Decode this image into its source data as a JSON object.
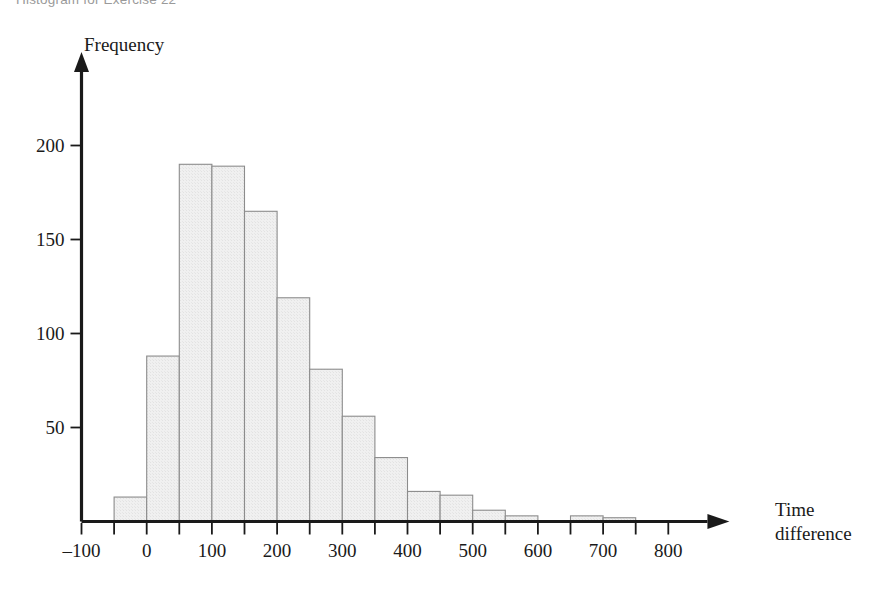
{
  "caption": "Histogram for Exercise 22",
  "chart_data": {
    "type": "bar",
    "title": "Histogram for Exercise 22",
    "xlabel": "Time difference",
    "xlabel_lines": [
      "Time",
      "difference"
    ],
    "ylabel": "Frequency",
    "xlim": [
      -100,
      850
    ],
    "ylim": [
      0,
      210
    ],
    "bin_width": 50,
    "grid": false,
    "legend": null,
    "x_ticks": [
      -100,
      -50,
      0,
      50,
      100,
      150,
      200,
      250,
      300,
      350,
      400,
      450,
      500,
      550,
      600,
      650,
      700,
      750,
      800
    ],
    "x_tick_labels": [
      {
        "value": -100,
        "label": "–100"
      },
      {
        "value": 0,
        "label": "0"
      },
      {
        "value": 100,
        "label": "100"
      },
      {
        "value": 200,
        "label": "200"
      },
      {
        "value": 300,
        "label": "300"
      },
      {
        "value": 400,
        "label": "400"
      },
      {
        "value": 500,
        "label": "500"
      },
      {
        "value": 600,
        "label": "600"
      },
      {
        "value": 700,
        "label": "700"
      },
      {
        "value": 800,
        "label": "800"
      }
    ],
    "y_ticks": [
      50,
      100,
      150,
      200
    ],
    "y_tick_labels": [
      "50",
      "100",
      "150",
      "200"
    ],
    "bins": [
      {
        "start": -50,
        "end": 0,
        "value": 13
      },
      {
        "start": 0,
        "end": 50,
        "value": 88
      },
      {
        "start": 50,
        "end": 100,
        "value": 190
      },
      {
        "start": 100,
        "end": 150,
        "value": 189
      },
      {
        "start": 150,
        "end": 200,
        "value": 165
      },
      {
        "start": 200,
        "end": 250,
        "value": 119
      },
      {
        "start": 250,
        "end": 300,
        "value": 81
      },
      {
        "start": 300,
        "end": 350,
        "value": 56
      },
      {
        "start": 350,
        "end": 400,
        "value": 34
      },
      {
        "start": 400,
        "end": 450,
        "value": 16
      },
      {
        "start": 450,
        "end": 500,
        "value": 14
      },
      {
        "start": 500,
        "end": 550,
        "value": 6
      },
      {
        "start": 550,
        "end": 600,
        "value": 3
      },
      {
        "start": 650,
        "end": 700,
        "value": 3
      },
      {
        "start": 700,
        "end": 750,
        "value": 2
      }
    ],
    "categories": [
      "-50",
      "0",
      "50",
      "100",
      "150",
      "200",
      "250",
      "300",
      "350",
      "400",
      "450",
      "500",
      "550",
      "650",
      "700"
    ],
    "values": [
      13,
      88,
      190,
      189,
      165,
      119,
      81,
      56,
      34,
      16,
      14,
      6,
      3,
      3,
      2
    ],
    "colors": {
      "bar_fill": "#f0f0f0",
      "bar_stroke": "#8c8c8c",
      "axis": "#1a1a1a",
      "caption": "#9a9a9a",
      "background": "#ffffff"
    }
  }
}
